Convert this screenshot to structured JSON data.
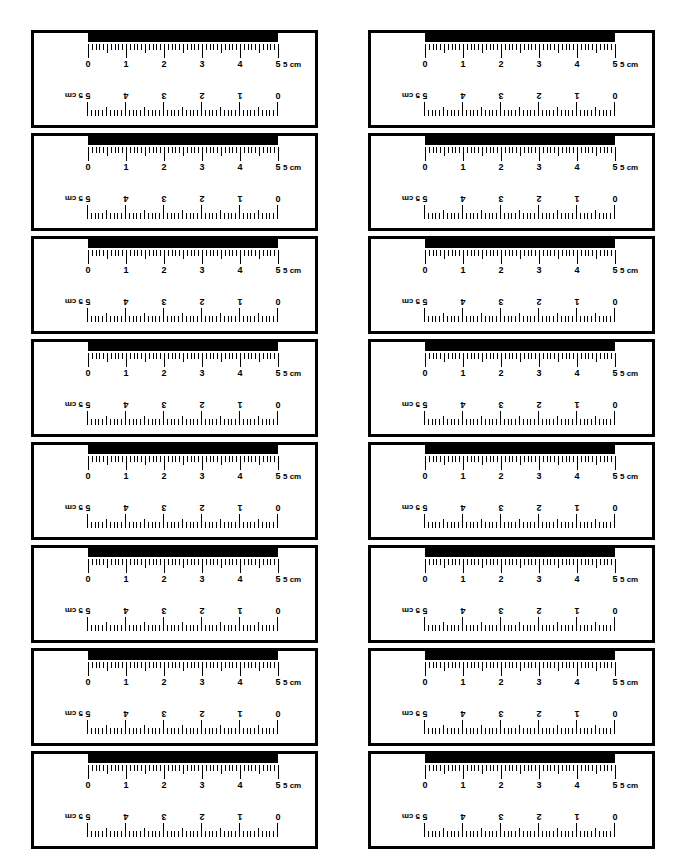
{
  "page": {
    "kind": "printable-worksheet",
    "card_count": 16,
    "columns": 2,
    "rows": 8,
    "background_color": "#ffffff",
    "ink_color": "#000000"
  },
  "ruler": {
    "unit_label": "5 cm",
    "unit_abbrev": "cm",
    "length_cm": 5,
    "minor_divisions_per_cm": 10,
    "top_scale_numbers": [
      "0",
      "1",
      "2",
      "3",
      "4",
      "5"
    ],
    "bottom_scale_numbers": [
      "5",
      "4",
      "3",
      "2",
      "1",
      "0"
    ],
    "bottom_scale_rotated": true,
    "has_solid_black_bar": true
  },
  "cards": [
    {
      "index": 1,
      "column": "left",
      "row": 1
    },
    {
      "index": 2,
      "column": "right",
      "row": 1
    },
    {
      "index": 3,
      "column": "left",
      "row": 2
    },
    {
      "index": 4,
      "column": "right",
      "row": 2
    },
    {
      "index": 5,
      "column": "left",
      "row": 3
    },
    {
      "index": 6,
      "column": "right",
      "row": 3
    },
    {
      "index": 7,
      "column": "left",
      "row": 4
    },
    {
      "index": 8,
      "column": "right",
      "row": 4
    },
    {
      "index": 9,
      "column": "left",
      "row": 5
    },
    {
      "index": 10,
      "column": "right",
      "row": 5
    },
    {
      "index": 11,
      "column": "left",
      "row": 6
    },
    {
      "index": 12,
      "column": "right",
      "row": 6
    },
    {
      "index": 13,
      "column": "left",
      "row": 7
    },
    {
      "index": 14,
      "column": "right",
      "row": 7
    },
    {
      "index": 15,
      "column": "left",
      "row": 8
    },
    {
      "index": 16,
      "column": "right",
      "row": 8
    }
  ]
}
